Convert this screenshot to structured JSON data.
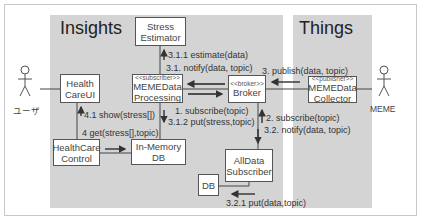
{
  "diagram": {
    "type": "uml-communication-diagram",
    "regions": [
      {
        "id": "insights",
        "title": "Insights"
      },
      {
        "id": "things",
        "title": "Things"
      }
    ],
    "actors": [
      {
        "id": "user",
        "label": "ユーザ"
      },
      {
        "id": "meme",
        "label": "MEME"
      }
    ],
    "components": {
      "stress_estimator": {
        "line1": "Stress",
        "line2": "Estimator"
      },
      "healthcare_ui": {
        "line1": "Health",
        "line2": "CareUI"
      },
      "meme_data_processing": {
        "stereotype": "<<subscriber>>",
        "line1": "MEMEData",
        "line2": "Processing"
      },
      "broker": {
        "stereotype": "<<broker>>",
        "line1": "Broker"
      },
      "meme_data_collector": {
        "stereotype": "<<publisher>>",
        "line1": "MEMEData",
        "line2": "Collector"
      },
      "healthcare_control": {
        "line1": "HealthCare",
        "line2": "Control"
      },
      "in_memory_db": {
        "line1": "In-Memory",
        "line2": "DB"
      },
      "alldata_subscriber": {
        "line1": "AllData",
        "line2": "Subscriber"
      },
      "db": {
        "line1": "DB"
      }
    },
    "messages": {
      "m311": "3.1.1 estimate(data)",
      "m31": "3.1. notify(data, topic)",
      "m3": "3. publish(data, topic)",
      "m1": "1. subscribe(topic)",
      "m312": "3.1.2 put(stress,topic)",
      "m41": "4.1 show(stress[])",
      "m4": "4 get(stress[],topic)",
      "m2": "2. subscribe(topic)",
      "m32": "3.2. notify(data, topic)",
      "m321": "3.2.1 put(data,topic)"
    },
    "colors": {
      "region_fill": "#d4d4d4",
      "box_border": "#555555",
      "line": "#333333",
      "frame_border": "#c8c8c8"
    }
  }
}
